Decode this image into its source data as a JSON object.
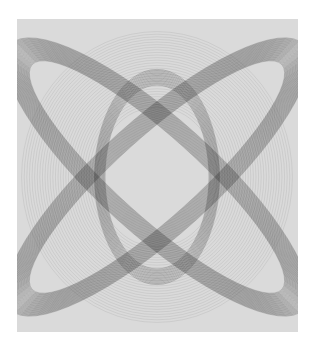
{
  "artwork": {
    "subject": "harmonograph line drawing",
    "colors": {
      "page_background": "#ffffff",
      "panel_background": "#dadada",
      "ink": "#111111"
    },
    "geometry": {
      "center": [
        140,
        158
      ],
      "x_band": {
        "count": 34,
        "rx_start": 40,
        "rx_step": 0.55,
        "ry_start": 168,
        "ry_step": 0.9,
        "angle_deg": 48,
        "opacity": 0.22
      },
      "outer_rings": {
        "count": 30,
        "rx_start": 60,
        "rx_step": 2.6,
        "ry_start": 70,
        "ry_step": 2.6,
        "opacity": 0.12
      },
      "center_oval": {
        "count": 14,
        "rx_start": 52,
        "rx_step": 0.8,
        "ry_start": 92,
        "ry_step": 1.2,
        "opacity": 0.3
      }
    }
  },
  "caption": {
    "text": ""
  }
}
